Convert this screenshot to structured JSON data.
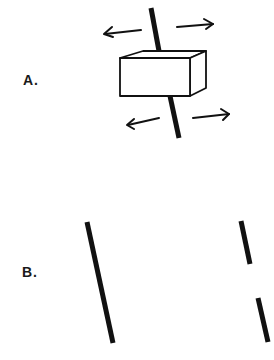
{
  "figure": {
    "panel_a": {
      "label": "A.",
      "description": "Block on a tilted rod with four arrows indicating lateral motion"
    },
    "panel_b": {
      "label": "B.",
      "description": "Left: continuous tilted line; right: same line broken into two offset segments"
    }
  },
  "colors": {
    "ink": "#111111",
    "background": "#ffffff"
  }
}
